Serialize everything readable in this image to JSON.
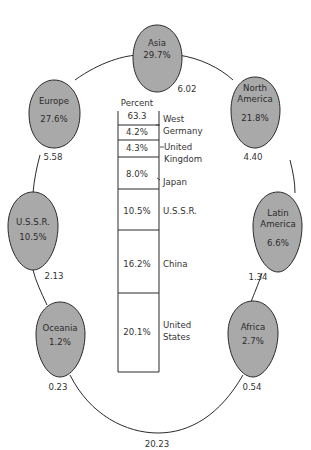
{
  "diagram": {
    "loop_total": "20.23",
    "regions": [
      {
        "id": "asia",
        "name_lines": [
          "Asia"
        ],
        "percent": "29.7%",
        "link_value": "6.02"
      },
      {
        "id": "north-america",
        "name_lines": [
          "North",
          "America"
        ],
        "percent": "21.8%",
        "link_value": "4.40"
      },
      {
        "id": "latin-america",
        "name_lines": [
          "Latin",
          "America"
        ],
        "percent": "6.6%",
        "link_value": "1.34"
      },
      {
        "id": "africa",
        "name_lines": [
          "Africa"
        ],
        "percent": "2.7%",
        "link_value": "0.54"
      },
      {
        "id": "oceania",
        "name_lines": [
          "Oceania"
        ],
        "percent": "1.2%",
        "link_value": "0.23"
      },
      {
        "id": "ussr",
        "name_lines": [
          "U.S.S.R."
        ],
        "percent": "10.5%",
        "link_value": "2.13"
      },
      {
        "id": "europe",
        "name_lines": [
          "Europe"
        ],
        "percent": "27.6%",
        "link_value": "5.58"
      }
    ],
    "bar": {
      "header": "Percent",
      "segments": [
        {
          "value": "63.3",
          "label_lines": []
        },
        {
          "value": "4.2%",
          "label_lines": [
            "West",
            "Germany"
          ]
        },
        {
          "value": "4.3%",
          "label_lines": [
            "United",
            "Kingdom"
          ]
        },
        {
          "value": "8.0%",
          "label_lines": [
            "Japan"
          ]
        },
        {
          "value": "10.5%",
          "label_lines": [
            "U.S.S.R."
          ]
        },
        {
          "value": "16.2%",
          "label_lines": [
            "China"
          ]
        },
        {
          "value": "20.1%",
          "label_lines": [
            "United",
            "States"
          ]
        }
      ]
    },
    "colors": {
      "egg_fill": "#a9a9a9",
      "stroke": "#2a2a2a",
      "background": "#ffffff"
    }
  }
}
